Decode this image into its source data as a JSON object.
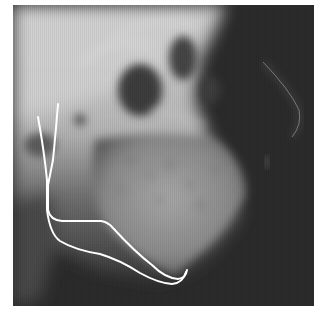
{
  "image": {
    "subject": "lateral cephalometric radiograph",
    "frame": {
      "x": 13,
      "y": 5,
      "width": 301,
      "height": 301
    },
    "tones": {
      "bone_light": "#d8d8d8",
      "bone_mid": "#9a9a9a",
      "sinus_dark": "#3a3a3a",
      "soft_tissue_bg": "#2b2b2b",
      "lower_left": "#555555",
      "tracing_line": "#ffffff",
      "nose_profile": "#8a8a8a"
    },
    "tracings": [
      {
        "name": "outer-mandible-tracing",
        "color": "#ffffff"
      },
      {
        "name": "inner-mandible-tracing",
        "color": "#ffffff"
      }
    ]
  }
}
